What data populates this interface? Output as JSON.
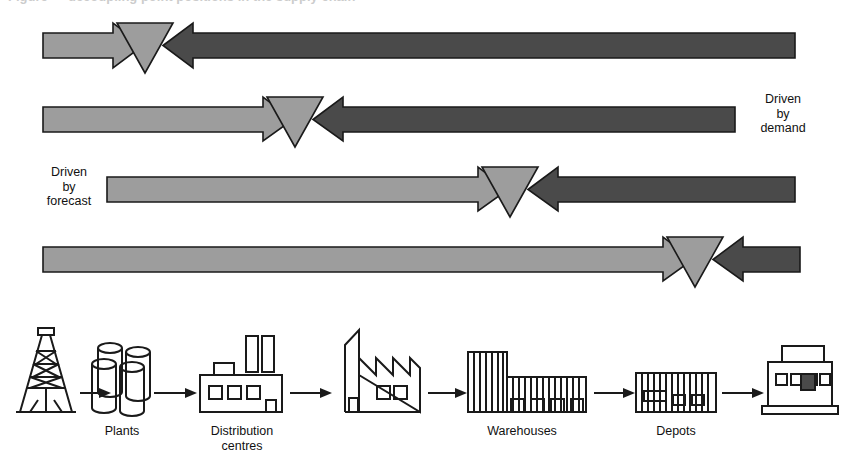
{
  "figure": {
    "caption_remnant": "Figure  —  decoupling point positions in the supply chain",
    "type": "supply-chain-decoupling-point-diagram"
  },
  "legend": {
    "demand_label": "Driven\nby\ndemand",
    "forecast_label": "Driven\nby\nforecast"
  },
  "colors": {
    "forecast_fill": "#9d9d9d",
    "demand_fill": "#4a4a4a",
    "decoupling_fill": "#9d9d9d",
    "outline": "#1a1a1a",
    "background": "#ffffff",
    "icon_stroke": "#1a1a1a"
  },
  "bands": [
    {
      "row": 1,
      "forecast_arrow": {
        "x_start": 43,
        "x_tip": 143,
        "y_top": 23,
        "y_bottom": 68,
        "direction": "right"
      },
      "decoupling_point": {
        "cx": 145,
        "cy": 23,
        "half_width": 28,
        "height": 50,
        "shape": "down-triangle"
      },
      "demand_arrow": {
        "x_tip": 163,
        "x_end": 795,
        "y_top": 23,
        "y_bottom": 68,
        "direction": "left"
      }
    },
    {
      "row": 2,
      "forecast_arrow": {
        "x_start": 43,
        "x_tip": 293,
        "y_top": 97,
        "y_bottom": 141,
        "direction": "right"
      },
      "decoupling_point": {
        "cx": 295,
        "cy": 97,
        "half_width": 28,
        "height": 50,
        "shape": "down-triangle"
      },
      "demand_arrow": {
        "x_tip": 313,
        "x_end": 735,
        "y_top": 97,
        "y_bottom": 141,
        "direction": "left"
      }
    },
    {
      "row": 3,
      "forecast_arrow": {
        "x_start": 107,
        "x_tip": 508,
        "y_top": 167,
        "y_bottom": 211,
        "direction": "right"
      },
      "decoupling_point": {
        "cx": 510,
        "cy": 167,
        "half_width": 28,
        "height": 50,
        "shape": "down-triangle"
      },
      "demand_arrow": {
        "x_tip": 528,
        "x_end": 795,
        "y_top": 167,
        "y_bottom": 211,
        "direction": "left"
      }
    },
    {
      "row": 4,
      "forecast_arrow": {
        "x_start": 43,
        "x_tip": 693,
        "y_top": 237,
        "y_bottom": 281,
        "direction": "right"
      },
      "decoupling_point": {
        "cx": 695,
        "cy": 237,
        "half_width": 28,
        "height": 50,
        "shape": "down-triangle"
      },
      "demand_arrow": {
        "x_tip": 713,
        "x_end": 800,
        "y_top": 237,
        "y_bottom": 281,
        "direction": "left"
      }
    }
  ],
  "chain": {
    "nodes": [
      {
        "id": "source",
        "icon": "oil-derrick-icon",
        "label": "",
        "cx": 46
      },
      {
        "id": "plants",
        "icon": "storage-tanks-icon",
        "label": "Plants",
        "cx": 122
      },
      {
        "id": "dc",
        "icon": "factory-two-chimneys-icon",
        "label": "Distribution\ncentres",
        "cx": 242
      },
      {
        "id": "sawtooth",
        "icon": "sawtooth-factory-icon",
        "label": "",
        "cx": 378
      },
      {
        "id": "wh",
        "icon": "warehouse-block-icon",
        "label": "Warehouses",
        "cx": 522
      },
      {
        "id": "depots",
        "icon": "long-shed-icon",
        "label": "Depots",
        "cx": 676
      },
      {
        "id": "store",
        "icon": "retail-store-icon",
        "label": "",
        "cx": 800
      }
    ],
    "connectors": [
      {
        "from": "source",
        "to": "plants",
        "x1": 78,
        "x2": 100,
        "y": 393
      },
      {
        "from": "plants",
        "to": "dc",
        "x1": 152,
        "x2": 196,
        "y": 393
      },
      {
        "from": "dc",
        "to": "sawtooth",
        "x1": 290,
        "x2": 330,
        "y": 393
      },
      {
        "from": "sawtooth",
        "to": "wh",
        "x1": 424,
        "x2": 464,
        "y": 393
      },
      {
        "from": "wh",
        "to": "depots",
        "x1": 592,
        "x2": 632,
        "y": 393
      },
      {
        "from": "depots",
        "to": "store",
        "x1": 722,
        "x2": 760,
        "y": 393
      }
    ]
  }
}
